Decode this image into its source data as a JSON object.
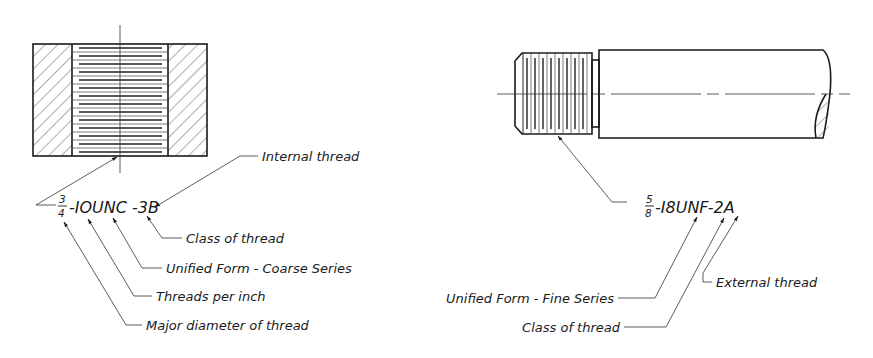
{
  "figure": {
    "colors": {
      "ink": "#1a1a1a",
      "background": "#ffffff"
    },
    "internal": {
      "callout": {
        "fraction_num": "3",
        "fraction_den": "4",
        "rest": "-IOUNC -3B"
      },
      "labels": {
        "internal_thread": "Internal thread",
        "class_of_thread": "Class of thread",
        "unified_coarse": "Unified Form - Coarse Series",
        "threads_per_inch": "Threads per inch",
        "major_diameter": "Major diameter of thread"
      }
    },
    "external": {
      "callout": {
        "fraction_num": "5",
        "fraction_den": "8",
        "rest": "-I8UNF-2A"
      },
      "labels": {
        "unified_fine": "Unified Form - Fine Series",
        "class_of_thread": "Class of thread",
        "external_thread": "External thread"
      }
    }
  }
}
